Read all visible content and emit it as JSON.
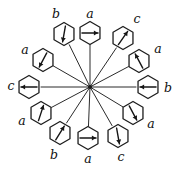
{
  "figure": {
    "type": "radial-hexagon-arrow-diagram",
    "title": "",
    "canvas": {
      "width": 181,
      "height": 170
    },
    "center": {
      "x": 90,
      "y": 87
    },
    "hub_label": "",
    "hexagon_radius": 11.5,
    "spoke_count": 12,
    "label_alphabet": [
      "a",
      "b",
      "c"
    ],
    "nodes": [
      {
        "id": "node-top-center",
        "label": "a",
        "position_deg": 90,
        "hex_center": {
          "x": 90,
          "y": 33
        },
        "label_pos": {
          "x": 90,
          "y": 14
        },
        "arrow_direction": "right",
        "arrow_deg": 0
      },
      {
        "id": "node-upper-right-outer",
        "label": "c",
        "position_deg": 60,
        "hex_center": {
          "x": 123,
          "y": 38
        },
        "label_pos": {
          "x": 137,
          "y": 19
        },
        "arrow_direction": "up-right",
        "arrow_deg": 55
      },
      {
        "id": "node-upper-right-inner",
        "label": "a",
        "position_deg": 30,
        "hex_center": {
          "x": 139,
          "y": 61
        },
        "label_pos": {
          "x": 158,
          "y": 49
        },
        "arrow_direction": "up-left",
        "arrow_deg": 118
      },
      {
        "id": "node-right-center",
        "label": "b",
        "position_deg": 0,
        "hex_center": {
          "x": 148,
          "y": 87
        },
        "label_pos": {
          "x": 168,
          "y": 88
        },
        "arrow_direction": "left",
        "arrow_deg": 180
      },
      {
        "id": "node-lower-right-inner",
        "label": "a",
        "position_deg": -30,
        "hex_center": {
          "x": 133,
          "y": 113
        },
        "label_pos": {
          "x": 151,
          "y": 124
        },
        "arrow_direction": "down-right",
        "arrow_deg": -62
      },
      {
        "id": "node-lower-right-outer",
        "label": "c",
        "position_deg": -60,
        "hex_center": {
          "x": 118,
          "y": 136
        },
        "label_pos": {
          "x": 121,
          "y": 157
        },
        "arrow_direction": "down",
        "arrow_deg": -80
      },
      {
        "id": "node-bottom-center",
        "label": "a",
        "position_deg": -90,
        "hex_center": {
          "x": 88,
          "y": 138
        },
        "label_pos": {
          "x": 88,
          "y": 159
        },
        "arrow_direction": "right",
        "arrow_deg": 0
      },
      {
        "id": "node-lower-left-outer",
        "label": "b",
        "position_deg": -120,
        "hex_center": {
          "x": 60,
          "y": 133
        },
        "label_pos": {
          "x": 54,
          "y": 155
        },
        "arrow_direction": "up-right",
        "arrow_deg": 58
      },
      {
        "id": "node-lower-left-inner",
        "label": "a",
        "position_deg": -150,
        "hex_center": {
          "x": 41,
          "y": 113
        },
        "label_pos": {
          "x": 22,
          "y": 121
        },
        "arrow_direction": "up-right",
        "arrow_deg": 72
      },
      {
        "id": "node-left-center",
        "label": "c",
        "position_deg": 180,
        "hex_center": {
          "x": 29,
          "y": 87
        },
        "label_pos": {
          "x": 11,
          "y": 86
        },
        "arrow_direction": "left",
        "arrow_deg": 180
      },
      {
        "id": "node-upper-left-inner",
        "label": "a",
        "position_deg": 150,
        "hex_center": {
          "x": 43,
          "y": 60
        },
        "label_pos": {
          "x": 25,
          "y": 50
        },
        "arrow_direction": "down-left",
        "arrow_deg": -118
      },
      {
        "id": "node-upper-left-outer",
        "label": "b",
        "position_deg": 120,
        "hex_center": {
          "x": 64,
          "y": 34
        },
        "label_pos": {
          "x": 56,
          "y": 14
        },
        "arrow_direction": "down-left",
        "arrow_deg": -100
      }
    ],
    "colors": {
      "ink": "#1d1d1d",
      "spoke": "#2b2b2b",
      "background": "#ffffff"
    }
  }
}
